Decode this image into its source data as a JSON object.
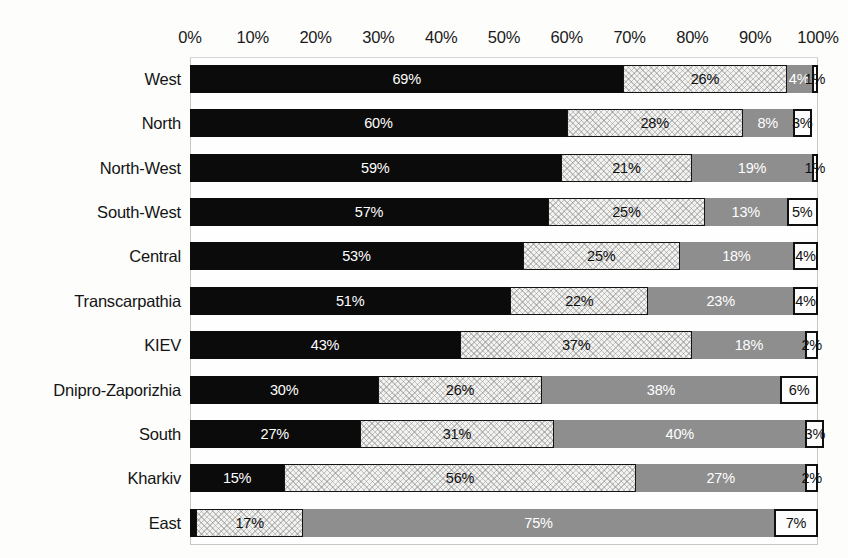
{
  "chart_data": {
    "type": "bar",
    "subtype": "horizontal-100%-stacked",
    "title": "",
    "xlabel": "",
    "ylabel": "",
    "xlim": [
      0,
      100
    ],
    "x_unit": "%",
    "grid": false,
    "legend": "none",
    "axis_position": "top",
    "tick_labels": [
      "0%",
      "10%",
      "20%",
      "30%",
      "40%",
      "50%",
      "60%",
      "70%",
      "80%",
      "90%",
      "100%"
    ],
    "tick_values": [
      0,
      10,
      20,
      30,
      40,
      50,
      60,
      70,
      80,
      90,
      100
    ],
    "categories": [
      "West",
      "North",
      "North-West",
      "South-West",
      "Central",
      "Transcarpathia",
      "KIEV",
      "Dnipro-Zaporizhia",
      "South",
      "Kharkiv",
      "East"
    ],
    "series": [
      {
        "name": "series-1",
        "style": "solid-black",
        "color": "#0b0b0b",
        "values": [
          69,
          60,
          59,
          57,
          53,
          51,
          43,
          30,
          27,
          15,
          1
        ]
      },
      {
        "name": "series-2",
        "style": "light-hatched-outlined",
        "color": "#f2f2f0",
        "values": [
          26,
          28,
          21,
          25,
          25,
          22,
          37,
          26,
          31,
          56,
          17
        ]
      },
      {
        "name": "series-3",
        "style": "medium-gray",
        "color": "#8e8e8e",
        "values": [
          4,
          8,
          19,
          13,
          18,
          23,
          18,
          38,
          40,
          27,
          75
        ]
      },
      {
        "name": "series-4",
        "style": "white-outlined",
        "color": "#fdfdfd",
        "values": [
          1,
          3,
          1,
          5,
          4,
          4,
          2,
          6,
          3,
          2,
          7
        ]
      }
    ],
    "data_labels": [
      [
        "69%",
        "26%",
        "4%",
        "1%"
      ],
      [
        "60%",
        "28%",
        "8%",
        "3%"
      ],
      [
        "59%",
        "21%",
        "19%",
        "1%"
      ],
      [
        "57%",
        "25%",
        "13%",
        "5%"
      ],
      [
        "53%",
        "25%",
        "18%",
        "4%"
      ],
      [
        "51%",
        "22%",
        "23%",
        "4%"
      ],
      [
        "43%",
        "37%",
        "18%",
        "2%"
      ],
      [
        "30%",
        "26%",
        "38%",
        "6%"
      ],
      [
        "27%",
        "31%",
        "40%",
        "3%"
      ],
      [
        "15%",
        "56%",
        "27%",
        "2%"
      ],
      [
        "",
        "17%",
        "75%",
        "7%"
      ]
    ]
  }
}
